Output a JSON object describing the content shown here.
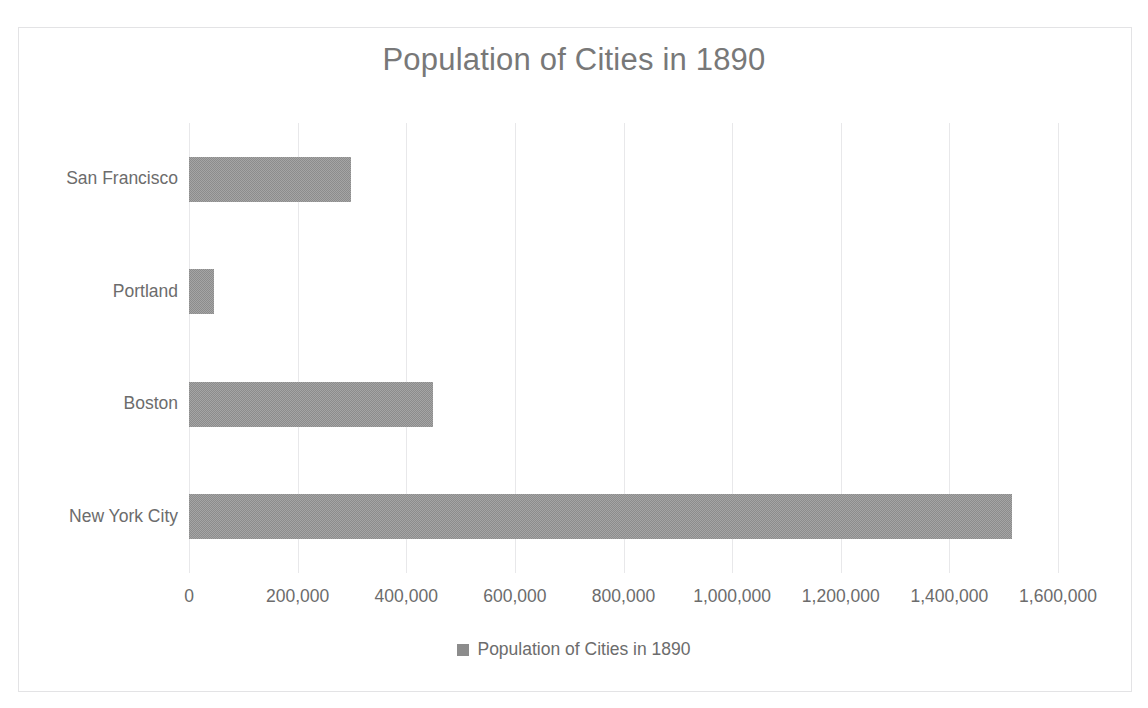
{
  "chart_data": {
    "type": "bar",
    "orientation": "horizontal",
    "title": "Population of Cities in 1890",
    "categories": [
      "New York City",
      "Boston",
      "Portland",
      "San Francisco"
    ],
    "values": [
      1515301,
      448477,
      46385,
      298997
    ],
    "series": [
      {
        "name": "Population of Cities in 1890",
        "values": [
          1515301,
          448477,
          46385,
          298997
        ]
      }
    ],
    "xlabel": "",
    "ylabel": "",
    "xlim": [
      0,
      1600000
    ],
    "xticks": [
      0,
      200000,
      400000,
      600000,
      800000,
      1000000,
      1200000,
      1400000,
      1600000
    ],
    "xtick_labels": [
      "0",
      "200,000",
      "400,000",
      "600,000",
      "800,000",
      "1,000,000",
      "1,200,000",
      "1,400,000",
      "1,600,000"
    ],
    "grid": "vertical",
    "legend": {
      "position": "bottom",
      "entries": [
        "Population of Cities in 1890"
      ]
    },
    "colors": {
      "bar": "#8c8c8c",
      "gridline": "#e8e8ea",
      "axis": "#d8d8da",
      "text": "#6c6c6c",
      "title_text": "#787878",
      "frame": "#e3e3e5",
      "background": "#ffffff"
    }
  },
  "legend": {
    "swatch_icon": "legend-square-icon",
    "label": "Population of Cities in 1890"
  }
}
